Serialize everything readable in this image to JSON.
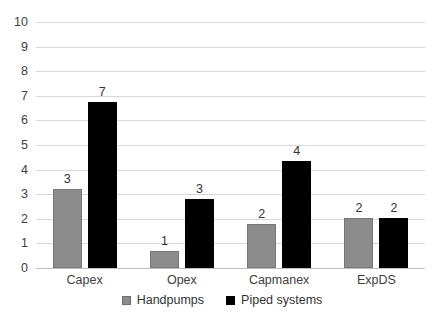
{
  "chart_data": {
    "type": "bar",
    "title": "",
    "subtitle": "",
    "xlabel": "",
    "ylabel": "",
    "ylim": [
      0,
      10
    ],
    "ytick_values": [
      0,
      1,
      2,
      3,
      4,
      5,
      6,
      7,
      8,
      9,
      10
    ],
    "ytick_labels": [
      "0",
      "1",
      "2",
      "3",
      "4",
      "5",
      "6",
      "7",
      "8",
      "9",
      "10"
    ],
    "grid": true,
    "legend_position": "bottom",
    "categories": [
      "Capex",
      "Opex",
      "Capmanex",
      "ExpDS"
    ],
    "series": [
      {
        "name": "Handpumps",
        "color": "#8c8c8c",
        "values": [
          3.2,
          0.7,
          1.8,
          2.05
        ],
        "data_labels": [
          "3",
          "1",
          "2",
          "2"
        ]
      },
      {
        "name": "Piped systems",
        "color": "#000000",
        "values": [
          6.75,
          2.8,
          4.35,
          2.05
        ],
        "data_labels": [
          "7",
          "3",
          "4",
          "2"
        ]
      }
    ]
  },
  "legend": {
    "items": [
      {
        "label": "Handpumps",
        "swatch": "handpumps"
      },
      {
        "label": "Piped systems",
        "swatch": "piped"
      }
    ]
  }
}
